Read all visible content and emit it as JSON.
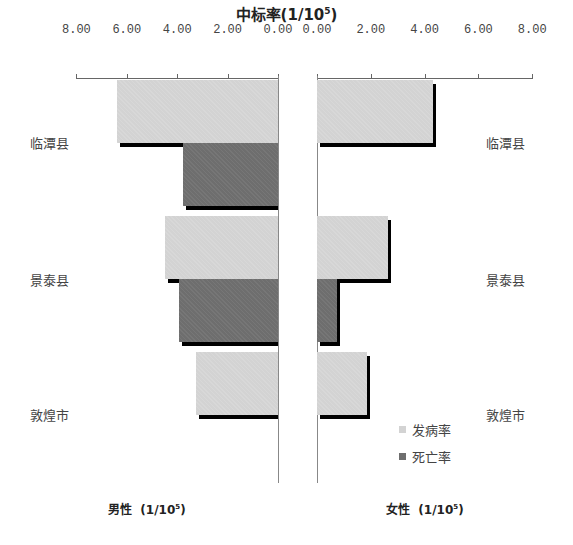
{
  "title": {
    "prefix": "中标率",
    "unit_base": "(1/10",
    "unit_exp": "5",
    "unit_close": ")"
  },
  "axis": {
    "left_ticks": [
      "8.00",
      "6.00",
      "4.00",
      "2.00",
      "0.00"
    ],
    "right_ticks": [
      "0.00",
      "2.00",
      "4.00",
      "6.00",
      "8.00"
    ]
  },
  "categories": [
    "临潭县",
    "景泰县",
    "敦煌市"
  ],
  "legend": {
    "incidence": "发病率",
    "mortality": "死亡率"
  },
  "bottom": {
    "male": {
      "label": "男性",
      "unit_base": "(1/10",
      "unit_exp": "5",
      "unit_close": ")"
    },
    "female": {
      "label": "女性",
      "unit_base": "(1/10",
      "unit_exp": "5",
      "unit_close": ")"
    }
  },
  "colors": {
    "incidence": "#d3d3d3",
    "mortality": "#6e6e6e",
    "shadow": "#000000"
  },
  "chart_data": {
    "type": "bar",
    "orientation": "horizontal-butterfly",
    "categories": [
      "临潭县",
      "景泰县",
      "敦煌市"
    ],
    "xlim": [
      0,
      8
    ],
    "xticks": [
      0,
      2,
      4,
      6,
      8
    ],
    "panels": [
      {
        "name": "男性 (1/10^5)",
        "side": "left",
        "series": [
          {
            "name": "发病率",
            "values": [
              6.38,
              4.49,
              3.27
            ]
          },
          {
            "name": "死亡率",
            "values": [
              3.78,
              3.94,
              0
            ]
          }
        ]
      },
      {
        "name": "女性 (1/10^5)",
        "side": "right",
        "series": [
          {
            "name": "发病率",
            "values": [
              4.31,
              2.64,
              1.85
            ]
          },
          {
            "name": "死亡率",
            "values": [
              0,
              0.74,
              0
            ]
          }
        ]
      }
    ],
    "legend": [
      "发病率",
      "死亡率"
    ],
    "legend_position": "lower-right",
    "grid": false
  }
}
